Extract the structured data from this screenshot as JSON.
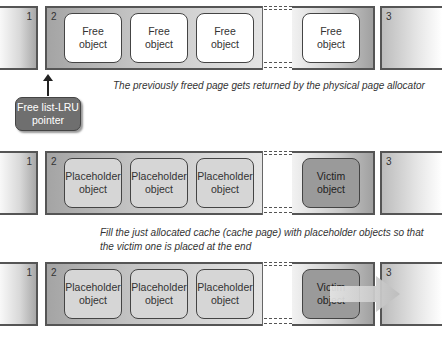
{
  "rows": [
    {
      "pages": {
        "left": "1",
        "current": "2",
        "right": "3"
      },
      "objects": [
        {
          "line1": "Free",
          "line2": "object",
          "kind": "free"
        },
        {
          "line1": "Free",
          "line2": "object",
          "kind": "free"
        },
        {
          "line1": "Free",
          "line2": "object",
          "kind": "free"
        },
        {
          "line1": "Free",
          "line2": "object",
          "kind": "free"
        }
      ],
      "caption": "The previously freed page gets returned by the physical page allocator"
    },
    {
      "pages": {
        "left": "1",
        "current": "2",
        "right": "3"
      },
      "objects": [
        {
          "line1": "Placeholder",
          "line2": "object",
          "kind": "placeholder"
        },
        {
          "line1": "Placeholder",
          "line2": "object",
          "kind": "placeholder"
        },
        {
          "line1": "Placeholder",
          "line2": "object",
          "kind": "placeholder"
        },
        {
          "line1": "Victim",
          "line2": "object",
          "kind": "victim"
        }
      ],
      "caption_line1": "Fill the just allocated cache (cache page) with placeholder objects so that",
      "caption_line2": "the victim one is placed at the end"
    },
    {
      "pages": {
        "left": "1",
        "current": "2",
        "right": "3"
      },
      "objects": [
        {
          "line1": "Placeholder",
          "line2": "object",
          "kind": "placeholder"
        },
        {
          "line1": "Placeholder",
          "line2": "object",
          "kind": "placeholder"
        },
        {
          "line1": "Placeholder",
          "line2": "object",
          "kind": "placeholder"
        },
        {
          "line1": "Victim",
          "line2": "object",
          "kind": "victim"
        }
      ],
      "arrow": "overflow-arrow-into-page-3"
    }
  ],
  "pointer": {
    "line1": "Free list-LRU",
    "line2": "pointer"
  },
  "colors": {
    "free": "#ffffff",
    "placeholder": "#d6d6d6",
    "victim": "#9a9a9a",
    "pointer_box": "#6f6f6f"
  }
}
